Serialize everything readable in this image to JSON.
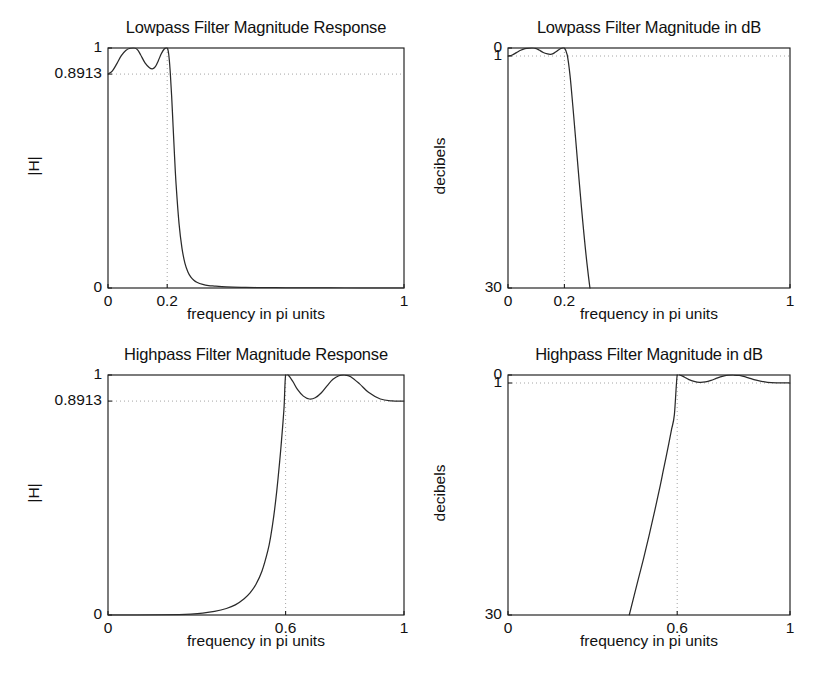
{
  "figure": {
    "background": "#ffffff",
    "curve_color": "#2a2a2a",
    "guide_color": "#9a9a9a",
    "axis_color": "#1d1d1d"
  },
  "panels": {
    "lowpass_mag": {
      "title": "Lowpass Filter Magnitude Response",
      "xlabel": "frequency in pi units",
      "ylabel": "|H|",
      "yticks": [
        "0",
        "0.8913",
        "1"
      ],
      "xticks": [
        "0",
        "0.2",
        "1"
      ]
    },
    "lowpass_db": {
      "title": "Lowpass Filter Magnitude in dB",
      "xlabel": "frequency in pi units",
      "ylabel": "decibels",
      "yticks": [
        "0",
        "1",
        "30"
      ],
      "xticks": [
        "0",
        "0.2",
        "1"
      ]
    },
    "highpass_mag": {
      "title": "Highpass Filter Magnitude Response",
      "xlabel": "frequency in pi units",
      "ylabel": "|H|",
      "yticks": [
        "0",
        "0.8913",
        "1"
      ],
      "xticks": [
        "0",
        "0.6",
        "1"
      ]
    },
    "highpass_db": {
      "title": "Highpass Filter Magnitude in dB",
      "xlabel": "frequency in pi units",
      "ylabel": "decibels",
      "yticks": [
        "0",
        "1",
        "30"
      ],
      "xticks": [
        "0",
        "0.6",
        "1"
      ]
    }
  },
  "chart_data": [
    {
      "type": "line",
      "id": "lowpass_mag",
      "title": "Lowpass Filter Magnitude Response",
      "xlabel": "frequency in pi units",
      "ylabel": "|H|",
      "xlim": [
        0,
        1
      ],
      "ylim": [
        0,
        1
      ],
      "xticks": [
        0,
        0.2,
        1
      ],
      "xticklabels": [
        "0",
        "0.2",
        "1"
      ],
      "yticks": [
        0,
        0.8913,
        1
      ],
      "yticklabels": [
        "0",
        "0.8913",
        "1"
      ],
      "grid": false,
      "legend": null,
      "guides": [
        {
          "kind": "hline",
          "y": 0.8913,
          "style": "dotted"
        },
        {
          "kind": "vline",
          "x": 0.2,
          "style": "dotted"
        }
      ],
      "series": [
        {
          "name": "|H(w)| lowpass",
          "x": [
            0.0,
            0.015,
            0.03,
            0.045,
            0.06,
            0.075,
            0.09,
            0.1,
            0.11,
            0.125,
            0.14,
            0.15,
            0.16,
            0.17,
            0.18,
            0.19,
            0.2,
            0.205,
            0.21,
            0.215,
            0.22,
            0.225,
            0.23,
            0.24,
            0.25,
            0.26,
            0.27,
            0.28,
            0.29,
            0.3,
            0.32,
            0.34,
            0.36,
            0.4,
            0.45,
            0.5,
            0.6,
            0.7,
            0.8,
            0.9,
            1.0
          ],
          "y": [
            0.8913,
            0.905,
            0.935,
            0.968,
            0.99,
            0.999,
            1.0,
            0.992,
            0.972,
            0.938,
            0.918,
            0.913,
            0.922,
            0.947,
            0.976,
            0.996,
            1.0,
            0.975,
            0.905,
            0.8,
            0.672,
            0.545,
            0.432,
            0.268,
            0.165,
            0.103,
            0.067,
            0.045,
            0.032,
            0.024,
            0.015,
            0.01,
            0.008,
            0.005,
            0.003,
            0.002,
            0.001,
            0.001,
            0.0,
            0.0,
            0.0
          ]
        }
      ]
    },
    {
      "type": "line",
      "id": "lowpass_db",
      "title": "Lowpass Filter Magnitude in dB",
      "xlabel": "frequency in pi units",
      "ylabel": "decibels",
      "xlim": [
        0,
        1
      ],
      "ylim": [
        -30,
        0
      ],
      "xticks": [
        0,
        0.2,
        1
      ],
      "xticklabels": [
        "0",
        "0.2",
        "1"
      ],
      "yticks": [
        0,
        -1,
        -30
      ],
      "yticklabels": [
        "0",
        "1",
        "30"
      ],
      "grid": false,
      "legend": null,
      "guides": [
        {
          "kind": "hline",
          "y": -1,
          "style": "dotted"
        },
        {
          "kind": "vline",
          "x": 0.2,
          "style": "dotted"
        }
      ],
      "series": [
        {
          "name": "20log10|H(w)| lowpass",
          "x": [
            0.0,
            0.015,
            0.03,
            0.045,
            0.06,
            0.075,
            0.09,
            0.1,
            0.11,
            0.125,
            0.14,
            0.15,
            0.16,
            0.17,
            0.18,
            0.19,
            0.2,
            0.21,
            0.22,
            0.23,
            0.24,
            0.26,
            0.28,
            0.3,
            0.32,
            0.34,
            0.35
          ],
          "y": [
            -1.0,
            -0.87,
            -0.58,
            -0.28,
            -0.09,
            -0.01,
            0.0,
            -0.07,
            -0.25,
            -0.56,
            -0.74,
            -0.79,
            -0.71,
            -0.47,
            -0.21,
            -0.03,
            0.0,
            -0.87,
            -3.45,
            -7.29,
            -11.44,
            -19.73,
            -26.93,
            -32.4,
            -36.48,
            -39.73,
            -41.0
          ]
        }
      ]
    },
    {
      "type": "line",
      "id": "highpass_mag",
      "title": "Highpass Filter Magnitude Response",
      "xlabel": "frequency in pi units",
      "ylabel": "|H|",
      "xlim": [
        0,
        1
      ],
      "ylim": [
        0,
        1
      ],
      "xticks": [
        0,
        0.6,
        1
      ],
      "xticklabels": [
        "0",
        "0.6",
        "1"
      ],
      "yticks": [
        0,
        0.8913,
        1
      ],
      "yticklabels": [
        "0",
        "0.8913",
        "1"
      ],
      "grid": false,
      "legend": null,
      "guides": [
        {
          "kind": "hline",
          "y": 0.8913,
          "style": "dotted"
        },
        {
          "kind": "vline",
          "x": 0.6,
          "style": "dotted"
        }
      ],
      "series": [
        {
          "name": "|H(w)| highpass",
          "x": [
            0.0,
            0.1,
            0.18,
            0.24,
            0.28,
            0.32,
            0.36,
            0.4,
            0.43,
            0.46,
            0.48,
            0.5,
            0.52,
            0.54,
            0.55,
            0.56,
            0.57,
            0.58,
            0.585,
            0.59,
            0.595,
            0.6,
            0.61,
            0.625,
            0.64,
            0.66,
            0.68,
            0.7,
            0.72,
            0.74,
            0.76,
            0.78,
            0.8,
            0.82,
            0.85,
            0.88,
            0.92,
            0.96,
            1.0
          ],
          "y": [
            0.0,
            0.0,
            0.001,
            0.002,
            0.004,
            0.008,
            0.015,
            0.027,
            0.042,
            0.068,
            0.092,
            0.128,
            0.182,
            0.268,
            0.33,
            0.412,
            0.515,
            0.64,
            0.71,
            0.785,
            0.87,
            1.0,
            0.998,
            0.972,
            0.94,
            0.912,
            0.9,
            0.905,
            0.925,
            0.955,
            0.982,
            0.997,
            1.0,
            0.993,
            0.963,
            0.928,
            0.9,
            0.892,
            0.8913
          ]
        }
      ]
    },
    {
      "type": "line",
      "id": "highpass_db",
      "title": "Highpass Filter Magnitude in dB",
      "xlabel": "frequency in pi units",
      "ylabel": "decibels",
      "xlim": [
        0,
        1
      ],
      "ylim": [
        -30,
        0
      ],
      "xticks": [
        0,
        0.6,
        1
      ],
      "xticklabels": [
        "0",
        "0.6",
        "1"
      ],
      "yticks": [
        0,
        -1,
        -30
      ],
      "yticklabels": [
        "0",
        "1",
        "30"
      ],
      "grid": false,
      "legend": null,
      "guides": [
        {
          "kind": "hline",
          "y": -1,
          "style": "dotted"
        },
        {
          "kind": "vline",
          "x": 0.6,
          "style": "dotted"
        }
      ],
      "series": [
        {
          "name": "20log10|H(w)| highpass",
          "x": [
            0.43,
            0.46,
            0.48,
            0.5,
            0.52,
            0.54,
            0.55,
            0.56,
            0.57,
            0.58,
            0.59,
            0.6,
            0.61,
            0.625,
            0.64,
            0.66,
            0.68,
            0.7,
            0.72,
            0.74,
            0.76,
            0.78,
            0.8,
            0.82,
            0.85,
            0.88,
            0.92,
            0.96,
            1.0
          ],
          "y": [
            -30.0,
            -25.8,
            -23.05,
            -20.1,
            -17.02,
            -13.8,
            -12.05,
            -10.35,
            -8.6,
            -6.8,
            -4.95,
            0.0,
            -0.02,
            -0.25,
            -0.54,
            -0.8,
            -0.92,
            -0.87,
            -0.68,
            -0.4,
            -0.16,
            -0.03,
            0.0,
            -0.06,
            -0.33,
            -0.65,
            -0.92,
            -0.99,
            -1.0
          ]
        }
      ]
    }
  ]
}
